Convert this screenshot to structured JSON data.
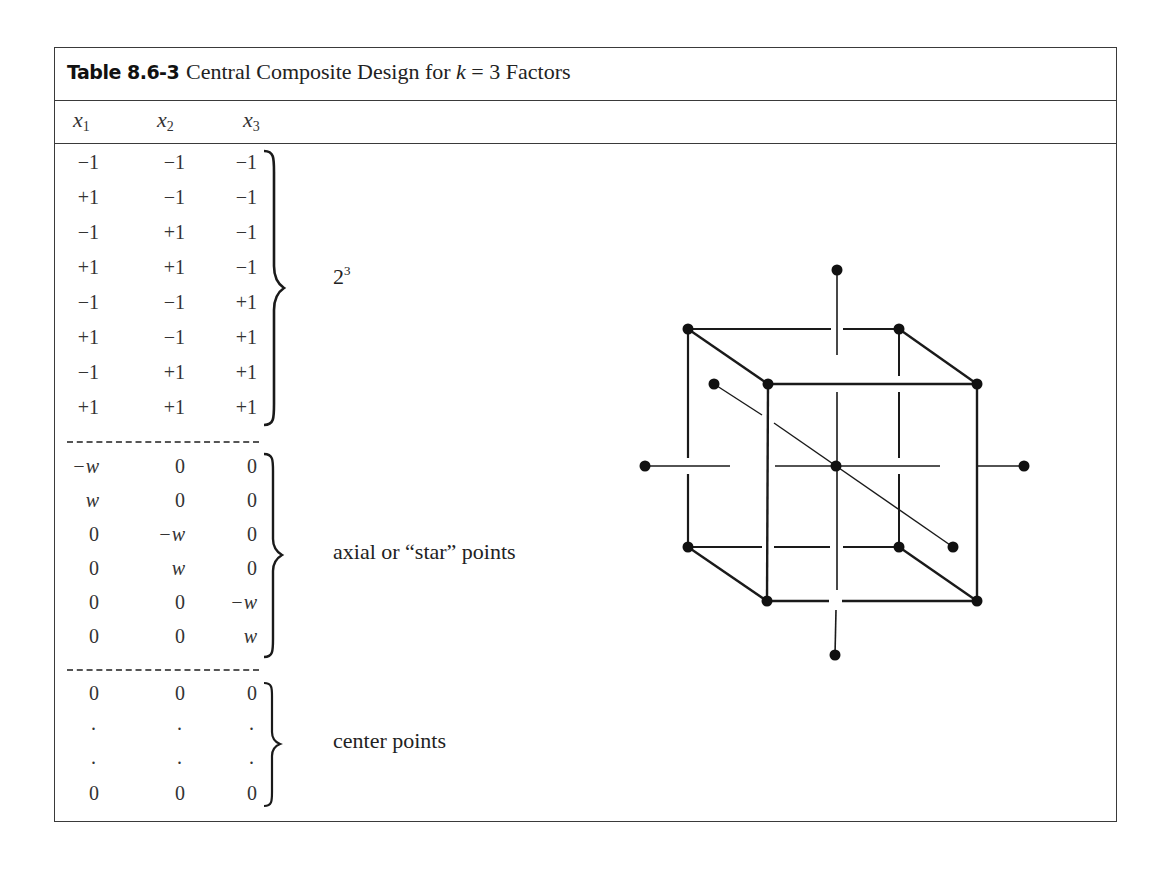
{
  "table": {
    "label": "Table 8.6-3",
    "title_prefix": "Central Composite Design for ",
    "title_var": "k",
    "title_eq": " = 3 Factors",
    "columns": [
      {
        "name": "x",
        "sub": "1"
      },
      {
        "name": "x",
        "sub": "2"
      },
      {
        "name": "x",
        "sub": "3"
      }
    ],
    "groups": [
      {
        "label_base": "2",
        "label_sup": "3",
        "rows": [
          [
            "−1",
            "−1",
            "−1"
          ],
          [
            "+1",
            "−1",
            "−1"
          ],
          [
            "−1",
            "+1",
            "−1"
          ],
          [
            "+1",
            "+1",
            "−1"
          ],
          [
            "−1",
            "−1",
            "+1"
          ],
          [
            "+1",
            "−1",
            "+1"
          ],
          [
            "−1",
            "+1",
            "+1"
          ],
          [
            "+1",
            "+1",
            "+1"
          ]
        ]
      },
      {
        "label": "axial or “star” points",
        "rows": [
          [
            "−w",
            "0",
            "0"
          ],
          [
            "w",
            "0",
            "0"
          ],
          [
            "0",
            "−w",
            "0"
          ],
          [
            "0",
            "w",
            "0"
          ],
          [
            "0",
            "0",
            "−w"
          ],
          [
            "0",
            "0",
            "w"
          ]
        ]
      },
      {
        "label": "center points",
        "rows": [
          [
            "0",
            "0",
            "0"
          ],
          [
            ".",
            ".",
            "."
          ],
          [
            ".",
            ".",
            "."
          ],
          [
            "0",
            "0",
            "0"
          ]
        ]
      }
    ]
  },
  "diagram": {
    "corner_points": 8,
    "axial_points": 6,
    "center_points": 1,
    "stroke_color": "#1a1a1a"
  }
}
